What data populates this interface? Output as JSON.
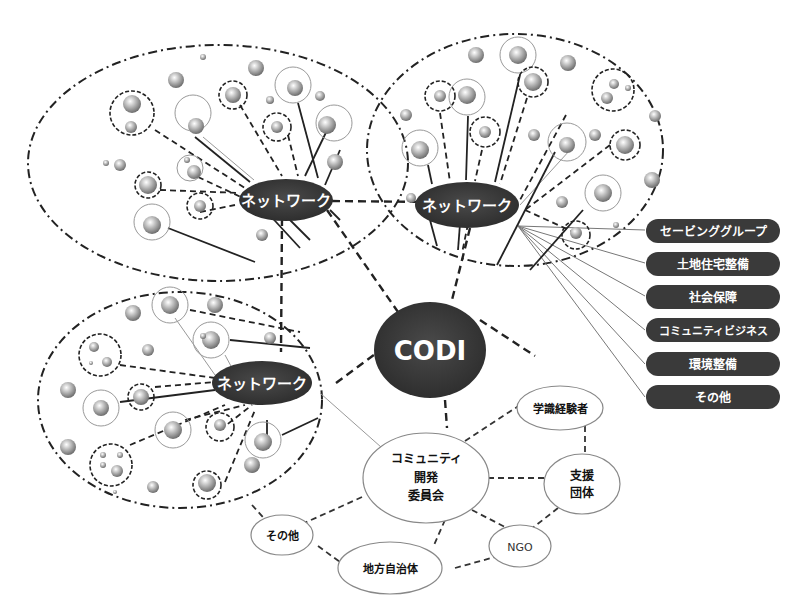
{
  "diagram": {
    "center": {
      "label": "CODI"
    },
    "networks": [
      {
        "id": "network-top-left",
        "label": "ネットワーク"
      },
      {
        "id": "network-top-right",
        "label": "ネットワーク"
      },
      {
        "id": "network-bottom-left",
        "label": "ネットワーク"
      }
    ],
    "activities": [
      {
        "label": "セービンググループ"
      },
      {
        "label": "土地住宅整備"
      },
      {
        "label": "社会保障"
      },
      {
        "label": "コミュニティビジネス"
      },
      {
        "label": "環境整備"
      },
      {
        "label": "その他"
      }
    ],
    "committee": {
      "line1": "コミュニティ",
      "line2": "開発",
      "line3": "委員会"
    },
    "stakeholders": [
      {
        "id": "academic",
        "label": "学識経験者"
      },
      {
        "id": "support-org",
        "line1": "支援",
        "line2": "団体"
      },
      {
        "id": "ngo",
        "label": "NGO"
      },
      {
        "id": "local-gov",
        "label": "地方自治体"
      },
      {
        "id": "other",
        "label": "その他"
      }
    ]
  },
  "colors": {
    "node_dark": "#3a3a3a",
    "line": "#222222",
    "thin_line": "#888888",
    "background": "#ffffff"
  }
}
